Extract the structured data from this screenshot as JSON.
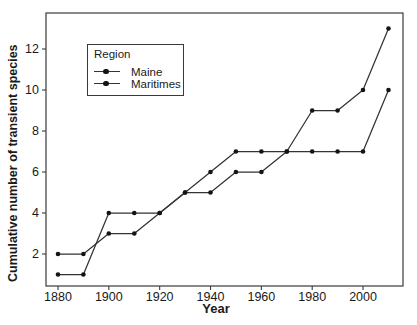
{
  "figure": {
    "background": "#ffffff",
    "line_color": "#333333",
    "marker_color": "#141414",
    "text_color": "#1a1a1a",
    "border_color": "#3a3a3a"
  },
  "axes": {
    "x_label": "Year",
    "y_label": "Cumulative number of transient species",
    "x_ticks": [
      1880,
      1900,
      1920,
      1940,
      1960,
      1980,
      2000
    ],
    "y_ticks": [
      2,
      4,
      6,
      8,
      10,
      12
    ]
  },
  "legend": {
    "title": "Region",
    "entries": [
      {
        "label": "Maine"
      },
      {
        "label": "Maritimes"
      }
    ]
  },
  "chart_data": {
    "type": "line",
    "title": "",
    "xlabel": "Year",
    "ylabel": "Cumulative number of transient species",
    "x": [
      1880,
      1890,
      1900,
      1910,
      1920,
      1930,
      1940,
      1950,
      1960,
      1970,
      1980,
      1990,
      2000,
      2010
    ],
    "series": [
      {
        "name": "Maine",
        "values": [
          1,
          1,
          4,
          4,
          4,
          5,
          6,
          7,
          7,
          7,
          9,
          9,
          10,
          13
        ]
      },
      {
        "name": "Maritimes",
        "values": [
          2,
          2,
          3,
          3,
          4,
          5,
          5,
          6,
          6,
          7,
          7,
          7,
          7,
          10
        ]
      }
    ],
    "x_ticks": [
      1880,
      1900,
      1920,
      1940,
      1960,
      1980,
      2000
    ],
    "y_ticks": [
      2,
      4,
      6,
      8,
      10,
      12
    ],
    "xlim": [
      1875,
      2016
    ],
    "ylim": [
      0.5,
      13.8
    ],
    "grid": false,
    "marker": "filled-circle",
    "legend_position": "upper-left",
    "legend_title": "Region"
  }
}
